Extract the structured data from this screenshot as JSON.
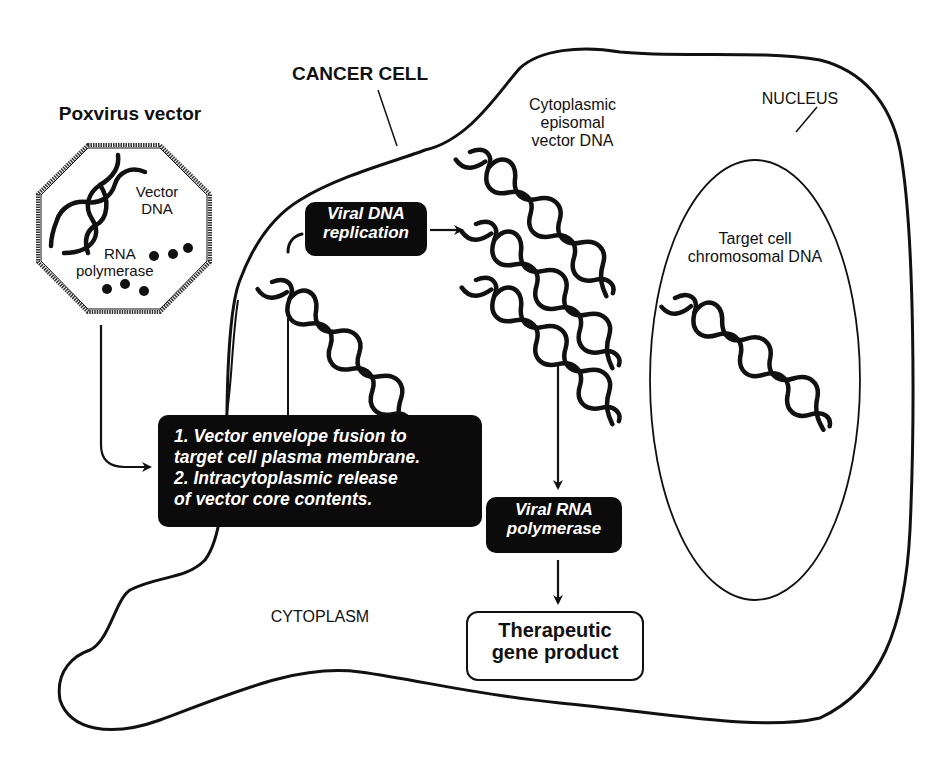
{
  "diagram": {
    "title_vector": "Poxvirus vector",
    "title_cell": "CANCER CELL",
    "virion": {
      "dna_label_1": "Vector",
      "dna_label_2": "DNA",
      "polymerase_label_1": "RNA",
      "polymerase_label_2": "polymerase"
    },
    "labels": {
      "episomal_1": "Cytoplasmic",
      "episomal_2": "episomal",
      "episomal_3": "vector DNA",
      "nucleus": "NUCLEUS",
      "chromosomal_1": "Target cell",
      "chromosomal_2": "chromosomal DNA",
      "cytoplasm": "CYTOPLASM"
    },
    "boxes": {
      "replication_1": "Viral DNA",
      "replication_2": "replication",
      "fusion_1": "1. Vector envelope fusion to",
      "fusion_2": "target cell plasma membrane.",
      "fusion_3": "2. Intracytoplasmic release",
      "fusion_4": "of vector core contents.",
      "rna_pol_1": "Viral RNA",
      "rna_pol_2": "polymerase",
      "product_1": "Therapeutic",
      "product_2": "gene product"
    },
    "colors": {
      "ink": "#111111",
      "box_fill": "#0b0b0b",
      "box_text": "#ffffff",
      "background": "#ffffff"
    }
  }
}
